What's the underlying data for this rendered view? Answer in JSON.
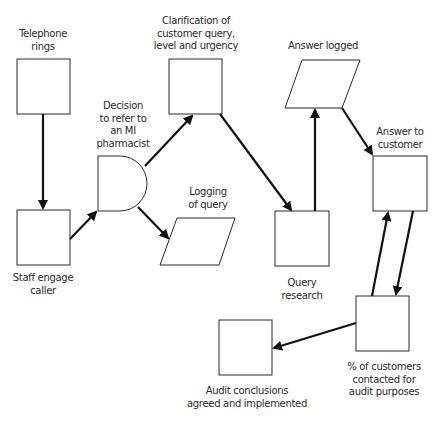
{
  "diagram": {
    "type": "flowchart",
    "nodes": [
      {
        "id": "telephone",
        "label": "Telephone\nrings",
        "shape": "rect"
      },
      {
        "id": "staff",
        "label": "Staff engage\ncaller",
        "shape": "rect"
      },
      {
        "id": "decision",
        "label": "Decision\nto refer to\nan MI\npharmacist",
        "shape": "delay"
      },
      {
        "id": "clarify",
        "label": "Clarification of\ncustomer query,\nlevel and urgency",
        "shape": "rect"
      },
      {
        "id": "logging",
        "label": "Logging\nof query",
        "shape": "parallelogram"
      },
      {
        "id": "answer_logged",
        "label": "Answer logged",
        "shape": "parallelogram"
      },
      {
        "id": "research",
        "label": "Query\nresearch",
        "shape": "rect"
      },
      {
        "id": "answer_customer",
        "label": "Answer to\ncustomer",
        "shape": "rect"
      },
      {
        "id": "percent",
        "label": "% of customers\ncontacted for\naudit purposes",
        "shape": "rect"
      },
      {
        "id": "audit",
        "label": "Audit conclusions\nagreed and implemented",
        "shape": "rect"
      }
    ],
    "edges": [
      {
        "from": "telephone",
        "to": "staff"
      },
      {
        "from": "staff",
        "to": "decision"
      },
      {
        "from": "decision",
        "to": "clarify"
      },
      {
        "from": "decision",
        "to": "logging"
      },
      {
        "from": "clarify",
        "to": "research"
      },
      {
        "from": "research",
        "to": "answer_logged"
      },
      {
        "from": "answer_logged",
        "to": "answer_customer"
      },
      {
        "from": "answer_customer",
        "to": "percent"
      },
      {
        "from": "percent",
        "to": "answer_customer"
      },
      {
        "from": "percent",
        "to": "audit"
      }
    ],
    "colors": {
      "stroke": "#1a1a1a",
      "fill": "#ffffff",
      "text": "#2a2a2a"
    }
  }
}
